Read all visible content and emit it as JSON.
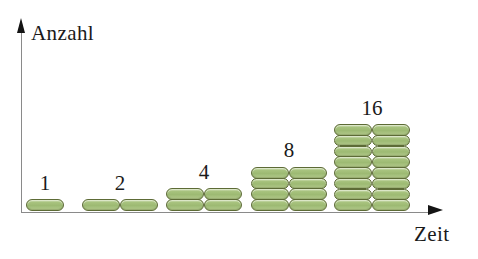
{
  "figure": {
    "background_color": "#ffffff",
    "title_fragment": "",
    "axes": {
      "y": {
        "label": "Anzahl",
        "arrow": "up-arrow-icon",
        "color": "#8a8a8a"
      },
      "x": {
        "label": "Zeit",
        "arrow": "right-arrow-icon",
        "color": "#8a8a8a"
      }
    },
    "cell_style": {
      "shape": "pill",
      "fill_color": "#a8c37e",
      "stroke_color": "#5d6b36"
    }
  },
  "chart_data": {
    "type": "bar",
    "title": "",
    "xlabel": "Zeit",
    "ylabel": "Anzahl",
    "categories": [
      "1",
      "2",
      "3",
      "4",
      "5"
    ],
    "values": [
      1,
      2,
      4,
      8,
      16
    ],
    "data_labels": [
      "1",
      "2",
      "4",
      "8",
      "16"
    ],
    "unit_glyph": "cell",
    "columns_per_group": [
      1,
      2,
      2,
      2,
      2
    ],
    "rows_per_group": [
      1,
      1,
      2,
      4,
      8
    ],
    "grid": false,
    "legend": "none"
  },
  "groups": [
    {
      "label": "1",
      "count": 1,
      "columns": 1,
      "rows": 1,
      "left": 26,
      "bottom": 212
    },
    {
      "label": "2",
      "count": 2,
      "columns": 2,
      "rows": 1,
      "left": 82,
      "bottom": 212
    },
    {
      "label": "4",
      "count": 4,
      "columns": 2,
      "rows": 2,
      "left": 166,
      "bottom": 212
    },
    {
      "label": "8",
      "count": 8,
      "columns": 2,
      "rows": 4,
      "left": 251,
      "bottom": 212
    },
    {
      "label": "16",
      "count": 16,
      "columns": 2,
      "rows": 8,
      "left": 334,
      "bottom": 212
    }
  ]
}
